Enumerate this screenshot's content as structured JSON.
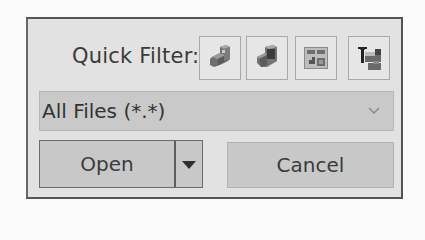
{
  "quick_filter": {
    "label": "Quick Filter:",
    "buttons": [
      {
        "icon": "part-filter-icon",
        "tooltip": ""
      },
      {
        "icon": "assembly-filter-icon",
        "tooltip": ""
      },
      {
        "icon": "drawing-filter-icon",
        "tooltip": ""
      },
      {
        "icon": "top-assembly-filter-icon",
        "tooltip": ""
      }
    ]
  },
  "file_type": {
    "selected": "All Files (*.*)",
    "chevron": "chevron-down-icon"
  },
  "actions": {
    "open_label": "Open",
    "open_dropdown_icon": "triangle-down-icon",
    "cancel_label": "Cancel"
  },
  "colors": {
    "panel_bg": "#e2e2e2",
    "panel_border": "#555555",
    "control_bg": "#c8c8c8",
    "text": "#3b3b3b"
  }
}
